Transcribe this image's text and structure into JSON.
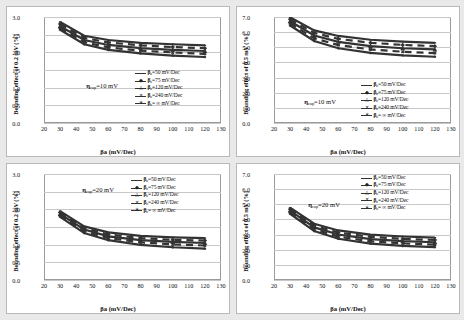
{
  "figure": {
    "background_color": "#e9e9e9",
    "panel_background": "#ffffff",
    "panel_border_color": "#b9b9b9",
    "grid_color": "#c8c8c8",
    "series_color": "#333333"
  },
  "common": {
    "xlabel": "βa  (mV/Dec)",
    "xticks": [
      "20",
      "30",
      "40",
      "50",
      "60",
      "70",
      "80",
      "90",
      "100",
      "110",
      "120",
      "130"
    ],
    "xlim": [
      20,
      130
    ],
    "legend_items": [
      {
        "label_prefix": "β",
        "label_sub": "c",
        "label_rest": "=50 mV/Dec",
        "marker": "–"
      },
      {
        "label_prefix": "β",
        "label_sub": "c",
        "label_rest": "=75 mV/Dec",
        "marker": "◆"
      },
      {
        "label_prefix": "β",
        "label_sub": "c",
        "label_rest": "=120 mV/Dec",
        "marker": "△"
      },
      {
        "label_prefix": "β",
        "label_sub": "c",
        "label_rest": "=240 mV/Dec",
        "marker": "✕"
      },
      {
        "label_prefix": "β",
        "label_sub": "c",
        "label_rest": "= ∞ mV/Dec",
        "marker": "∗"
      }
    ]
  },
  "chart_data": [
    {
      "id": "top-left",
      "type": "line",
      "title": "",
      "xlabel": "βa  (mV/Dec)",
      "ylabel": "Bounding effect of 0.2 mV (%)",
      "annotation": "ηcap=10 mV",
      "annotation_symbol": "η",
      "annotation_sub": "cap",
      "annotation_rest": "=10 mV",
      "xlim": [
        20,
        130
      ],
      "ylim": [
        0.0,
        3.0
      ],
      "yticks": [
        "0.0",
        "0.5",
        "1.0",
        "1.5",
        "2.0",
        "2.5",
        "3.0"
      ],
      "grid": true,
      "legend_position": "center-right",
      "x": [
        30,
        45,
        60,
        80,
        100,
        120
      ],
      "series": [
        {
          "name": "βc=50 mV/Dec",
          "values": [
            2.86,
            2.47,
            2.35,
            2.27,
            2.23,
            2.2
          ]
        },
        {
          "name": "βc=75 mV/Dec",
          "values": [
            2.8,
            2.41,
            2.28,
            2.2,
            2.15,
            2.12
          ]
        },
        {
          "name": "βc=120 mV/Dec",
          "values": [
            2.74,
            2.35,
            2.21,
            2.12,
            2.07,
            2.04
          ]
        },
        {
          "name": "βc=240 mV/Dec",
          "values": [
            2.69,
            2.29,
            2.14,
            2.05,
            2.0,
            1.96
          ]
        },
        {
          "name": "βc= ∞ mV/Dec",
          "values": [
            2.64,
            2.23,
            2.07,
            1.97,
            1.91,
            1.87
          ]
        }
      ]
    },
    {
      "id": "top-right",
      "type": "line",
      "title": "",
      "xlabel": "βa  (mV/Dec)",
      "ylabel": "Bounding effect of 0.5 mV  (%)",
      "annotation": "ηcap=10 mV",
      "annotation_symbol": "η",
      "annotation_sub": "cap",
      "annotation_rest": "=10 mV",
      "xlim": [
        20,
        130
      ],
      "ylim": [
        0.0,
        7.0
      ],
      "yticks": [
        "0.0",
        "1.0",
        "2.0",
        "3.0",
        "4.0",
        "5.0",
        "6.0",
        "7.0"
      ],
      "grid": true,
      "legend_position": "lower-right",
      "x": [
        30,
        45,
        60,
        80,
        100,
        120
      ],
      "series": [
        {
          "name": "βc=50 mV/Dec",
          "values": [
            6.98,
            6.12,
            5.75,
            5.5,
            5.38,
            5.3
          ]
        },
        {
          "name": "βc=75 mV/Dec",
          "values": [
            6.85,
            5.95,
            5.56,
            5.3,
            5.16,
            5.08
          ]
        },
        {
          "name": "βc=120 mV/Dec",
          "values": [
            6.72,
            5.78,
            5.36,
            5.08,
            4.94,
            4.86
          ]
        },
        {
          "name": "βc=240 mV/Dec",
          "values": [
            6.58,
            5.6,
            5.15,
            4.86,
            4.71,
            4.62
          ]
        },
        {
          "name": "βc= ∞ mV/Dec",
          "values": [
            6.44,
            5.42,
            4.94,
            4.63,
            4.47,
            4.38
          ]
        }
      ]
    },
    {
      "id": "bottom-left",
      "type": "line",
      "title": "",
      "xlabel": "βa  (mV/Dec)",
      "ylabel": "Bounding effect of 0.2 mV (%)",
      "annotation": "ηcap=20 mV",
      "annotation_symbol": "η",
      "annotation_sub": "cap",
      "annotation_rest": "=20 mV",
      "xlim": [
        20,
        130
      ],
      "ylim": [
        0.0,
        3.0
      ],
      "yticks": [
        "0.0",
        "0.5",
        "1.0",
        "1.5",
        "2.0",
        "2.5",
        "3.0"
      ],
      "grid": true,
      "legend_position": "upper-right",
      "x": [
        30,
        45,
        60,
        80,
        100,
        120
      ],
      "series": [
        {
          "name": "βc=50 mV/Dec",
          "values": [
            1.95,
            1.52,
            1.35,
            1.25,
            1.21,
            1.19
          ]
        },
        {
          "name": "βc=75 mV/Dec",
          "values": [
            1.91,
            1.47,
            1.29,
            1.19,
            1.14,
            1.12
          ]
        },
        {
          "name": "βc=120 mV/Dec",
          "values": [
            1.87,
            1.43,
            1.24,
            1.13,
            1.08,
            1.05
          ]
        },
        {
          "name": "βc=240 mV/Dec",
          "values": [
            1.83,
            1.38,
            1.19,
            1.07,
            1.01,
            0.98
          ]
        },
        {
          "name": "βc= ∞ mV/Dec",
          "values": [
            1.79,
            1.33,
            1.13,
            1.0,
            0.93,
            0.89
          ]
        }
      ]
    },
    {
      "id": "bottom-right",
      "type": "line",
      "title": "",
      "xlabel": "βa  (mV/Dec)",
      "ylabel": "Bounding effect of 0.5 mV  (%)",
      "annotation": "ηcap=20 mV",
      "annotation_symbol": "η",
      "annotation_sub": "cap",
      "annotation_rest": "=20 mV",
      "xlim": [
        20,
        130
      ],
      "ylim": [
        0.0,
        7.0
      ],
      "yticks": [
        "0.0",
        "1.0",
        "2.0",
        "3.0",
        "4.0",
        "5.0",
        "6.0",
        "7.0"
      ],
      "grid": true,
      "legend_position": "upper-right",
      "x": [
        30,
        45,
        60,
        80,
        100,
        120
      ],
      "series": [
        {
          "name": "βc=50 mV/Dec",
          "values": [
            4.78,
            3.72,
            3.28,
            3.0,
            2.88,
            2.8
          ]
        },
        {
          "name": "βc=75 mV/Dec",
          "values": [
            4.68,
            3.6,
            3.14,
            2.86,
            2.72,
            2.65
          ]
        },
        {
          "name": "βc=120 mV/Dec",
          "values": [
            4.58,
            3.48,
            3.01,
            2.71,
            2.57,
            2.5
          ]
        },
        {
          "name": "βc=240 mV/Dec",
          "values": [
            4.48,
            3.36,
            2.87,
            2.56,
            2.42,
            2.34
          ]
        },
        {
          "name": "βc= ∞ mV/Dec",
          "values": [
            4.38,
            3.24,
            2.73,
            2.41,
            2.26,
            2.18
          ]
        }
      ]
    }
  ]
}
